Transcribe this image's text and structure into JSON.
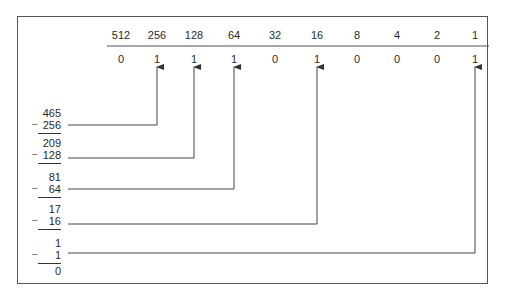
{
  "place_values": [
    "512",
    "256",
    "128",
    "64",
    "32",
    "16",
    "8",
    "4",
    "2",
    "1"
  ],
  "bits": [
    "0",
    "1",
    "1",
    "1",
    "0",
    "1",
    "0",
    "0",
    "0",
    "1"
  ],
  "column_x": [
    121,
    157,
    194,
    234,
    275,
    317,
    357,
    397,
    437,
    475
  ],
  "steps": [
    {
      "minuend": "465",
      "subtrahend": "256",
      "target_col": 1,
      "y": 152
    },
    {
      "minuend": "209",
      "subtrahend": "128",
      "target_col": 2,
      "y": 184
    },
    {
      "minuend": "81",
      "subtrahend": "64",
      "target_col": 3,
      "y": 215
    },
    {
      "minuend": "17",
      "subtrahend": "16",
      "target_col": 5,
      "y": 226
    },
    {
      "minuend": "1",
      "subtrahend": "1",
      "target_col": 9,
      "y": 253
    }
  ],
  "remainder": "0",
  "minus_sign": "−",
  "colors": {
    "line": "#333333",
    "frame": "#555555",
    "text": "#2a2a2a"
  }
}
